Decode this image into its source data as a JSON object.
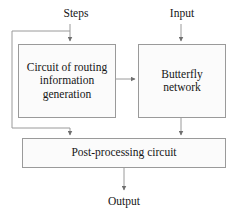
{
  "diagram": {
    "type": "block-diagram",
    "stroke_color": "#9a9a9a",
    "text_color": "#161616",
    "background_color": "#ffffff",
    "node_fill": "#fbfbfb",
    "inputs": [
      {
        "id": "steps",
        "label": "Steps",
        "target": "routing"
      },
      {
        "id": "input",
        "label": "Input",
        "target": "butterfly"
      }
    ],
    "outputs": [
      {
        "id": "output",
        "label": "Output",
        "source": "post"
      }
    ],
    "nodes": [
      {
        "id": "routing",
        "label": "Circuit of routing information generation",
        "lines": [
          "Circuit of",
          "routing",
          "information",
          "generation"
        ]
      },
      {
        "id": "butterfly",
        "label": "Butterfly network",
        "lines": [
          "Butterfly",
          "network"
        ]
      },
      {
        "id": "post",
        "label": "Post-processing circuit",
        "lines": [
          "Post-processing circuit"
        ]
      }
    ],
    "edges": [
      {
        "from": "steps",
        "to": "routing",
        "arrow": true
      },
      {
        "from": "input",
        "to": "butterfly",
        "arrow": true
      },
      {
        "from": "routing",
        "to": "butterfly",
        "arrow": true
      },
      {
        "from": "routing",
        "to": "post",
        "arrow": true
      },
      {
        "from": "butterfly",
        "to": "post",
        "arrow": true
      },
      {
        "from": "post",
        "to": "output",
        "arrow": true
      }
    ]
  }
}
